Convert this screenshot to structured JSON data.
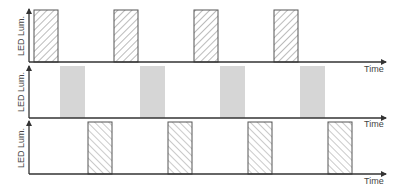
{
  "diagram": {
    "type": "timing-diagram",
    "colors": {
      "axis": "#333333",
      "hatch_stroke": "#555555",
      "gray_fill": "#d6d6d6",
      "text": "#444444"
    },
    "panels": [
      {
        "id": "panel-1",
        "y_label": "LED Lum.",
        "x_label": "Time",
        "pulse_style": "hatch-forward",
        "pulses": [
          {
            "x_start": 34,
            "x_end": 58
          },
          {
            "x_start": 114,
            "x_end": 138
          },
          {
            "x_start": 194,
            "x_end": 218
          },
          {
            "x_start": 274,
            "x_end": 298
          }
        ]
      },
      {
        "id": "panel-2",
        "y_label": "LED Lum.",
        "x_label": "Time",
        "pulse_style": "gray-fill",
        "pulses": [
          {
            "x_start": 60,
            "x_end": 85
          },
          {
            "x_start": 140,
            "x_end": 165
          },
          {
            "x_start": 220,
            "x_end": 245
          },
          {
            "x_start": 300,
            "x_end": 325
          }
        ]
      },
      {
        "id": "panel-3",
        "y_label": "LED Lum.",
        "x_label": "Time",
        "pulse_style": "hatch-backward",
        "pulses": [
          {
            "x_start": 88,
            "x_end": 112
          },
          {
            "x_start": 168,
            "x_end": 192
          },
          {
            "x_start": 248,
            "x_end": 272
          },
          {
            "x_start": 328,
            "x_end": 352
          }
        ]
      }
    ]
  }
}
